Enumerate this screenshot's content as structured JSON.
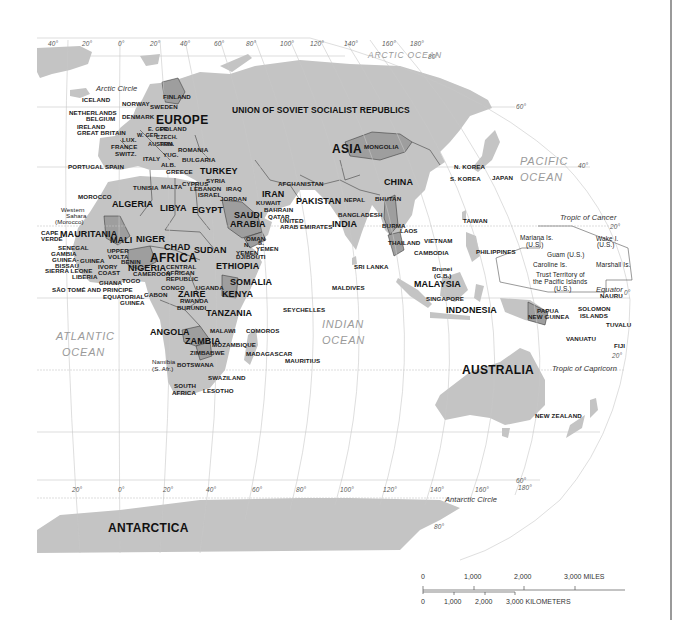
{
  "map": {
    "colors": {
      "land": "#c4c4c4",
      "highlight": "#9e9e9e",
      "ocean": "#ffffff",
      "graticule": "#bdbdbd",
      "border": "#2a2a2a",
      "ocean_label": "#9a9a9a"
    },
    "continents": {
      "europe": "EUROPE",
      "asia": "ASIA",
      "africa": "AFRICA",
      "australia": "AUSTRALIA",
      "antarctica": "ANTARCTICA"
    },
    "oceans": {
      "arctic": "ARCTIC OCEAN",
      "pacific_1": "PACIFIC",
      "pacific_2": "OCEAN",
      "atlantic_1": "ATLANTIC",
      "atlantic_2": "OCEAN",
      "indian_1": "INDIAN",
      "indian_2": "OCEAN"
    },
    "lines": {
      "arctic_circle": "Arctic Circle",
      "tropic_cancer": "Tropic of Cancer",
      "equator": "Equator",
      "tropic_capricorn": "Tropic of Capricorn",
      "antarctic_circle": "Antarctic Circle"
    },
    "graticule_top": [
      "40°",
      "20°",
      "0°",
      "20°",
      "40°",
      "60°",
      "80°",
      "100°",
      "120°",
      "140°",
      "160°",
      "180°"
    ],
    "graticule_bottom": [
      "20°",
      "0°",
      "20°",
      "40°",
      "60°",
      "80°",
      "100°",
      "120°",
      "140°",
      "160°",
      "180°"
    ],
    "latitudes": {
      "n80": "80°",
      "n60": "60°",
      "n40": "40°",
      "n20": "20°",
      "eq": "0°",
      "s20": "20°",
      "s60": "60°",
      "s80": "80°"
    },
    "countries": {
      "ussr": "UNION OF SOVIET SOCIALIST REPUBLICS",
      "iceland": "ICELAND",
      "norway": "NORWAY",
      "sweden": "SWEDEN",
      "finland": "FINLAND",
      "netherlands": "NETHERLANDS",
      "belgium": "BELGIUM",
      "denmark": "DENMARK",
      "ireland": "IRELAND",
      "great_britain": "GREAT BRITAIN",
      "poland": "POLAND",
      "w_ger": "W. GER.",
      "e_ger": "E. GER.",
      "czech": "CZECH.",
      "lux": "LUX.",
      "france": "FRANCE",
      "austria": "AUSTRIA",
      "hun": "HUN.",
      "switz": "SWITZ.",
      "romania": "ROMANIA",
      "yug": "YUG.",
      "italy": "ITALY",
      "bulgaria": "BULGARIA",
      "alb": "ALB.",
      "greece": "GREECE",
      "portugal": "PORTUGAL",
      "spain": "SPAIN",
      "turkey": "TURKEY",
      "cyprus": "CYPRUS",
      "syria": "SYRIA",
      "lebanon": "LEBANON",
      "israel": "ISRAEL",
      "iraq": "IRAQ",
      "jordan": "JORDAN",
      "iran": "IRAN",
      "afghanistan": "AFGHANISTAN",
      "kuwait": "KUWAIT",
      "bahrain": "BAHRAIN",
      "qatar": "QATAR",
      "uae_1": "UNITED",
      "uae_2": "ARAB EMIRATES",
      "pakistan": "PAKISTAN",
      "nepal": "NEPAL",
      "bhutan": "BHUTAN",
      "bangladesh": "BANGLADESH",
      "india": "INDIA",
      "mongolia": "MONGOLIA",
      "china": "CHINA",
      "n_korea": "N. KOREA",
      "s_korea": "S. KOREA",
      "japan": "JAPAN",
      "taiwan": "TAIWAN",
      "burma": "BURMA",
      "laos": "LAOS",
      "thailand": "THAILAND",
      "vietnam": "VIETNAM",
      "cambodia": "CAMBODIA",
      "philippines": "PHILIPPINES",
      "sri_lanka": "SRI LANKA",
      "maldives": "MALDIVES",
      "brunei_1": "Brunei",
      "brunei_2": "(G.B.)",
      "malaysia": "MALAYSIA",
      "singapore": "SINGAPORE",
      "indonesia": "INDONESIA",
      "png_1": "PAPUA",
      "png_2": "NEW GUINEA",
      "solomon_1": "SOLOMON",
      "solomon_2": "ISLANDS",
      "nauru": "NAURU",
      "tuvalu": "TUVALU",
      "vanuatu": "VANUATU",
      "fiji": "FIJI",
      "new_zealand": "NEW ZEALAND",
      "saudi_1": "SAUDI",
      "saudi_2": "ARABIA",
      "oman": "OMAN",
      "n_yemen_1": "N.",
      "n_yemen_2": "YEMEN",
      "s_yemen_1": "S.",
      "s_yemen_2": "YEMEN",
      "morocco": "MOROCCO",
      "tunisia": "TUNISIA",
      "malta": "MALTA",
      "algeria": "ALGERIA",
      "libya": "LIBYA",
      "egypt": "EGYPT",
      "w_sahara_1": "Western",
      "w_sahara_2": "Sahara",
      "w_sahara_3": "(Morocco)",
      "cape_verde_1": "CAPE",
      "cape_verde_2": "VERDE",
      "mauritania": "MAURITANIA",
      "mali": "MALI",
      "niger": "NIGER",
      "chad": "CHAD",
      "sudan": "SUDAN",
      "senegal": "SENEGAL",
      "gambia": "GAMBIA",
      "guinea_bissau_1": "GUINEA-",
      "guinea_bissau_2": "BISSAU",
      "guinea": "GUINEA",
      "upper_volta_1": "UPPER",
      "upper_volta_2": "VOLTA",
      "benin": "BENIN",
      "nigeria": "NIGERIA",
      "sierra_leone": "SIERRA LEONE",
      "liberia": "LIBERIA",
      "ivory_coast_1": "IVORY",
      "ivory_coast_2": "COAST",
      "ghana": "GHANA",
      "togo": "TOGO",
      "cameroon": "CAMEROON",
      "car_1": "CENTRAL",
      "car_2": "AFRICAN",
      "car_3": "REPUBLIC",
      "ethiopia": "ETHIOPIA",
      "djibouti": "DJIBOUTI",
      "somalia": "SOMALIA",
      "sao_tome": "SÃO TOMÉ AND PRINCIPE",
      "eq_guinea_1": "EQUATORIAL",
      "eq_guinea_2": "GUINEA",
      "gabon": "GABON",
      "congo": "CONGO",
      "zaire": "ZAIRE",
      "uganda": "UGANDA",
      "kenya": "KENYA",
      "rwanda": "RWANDA",
      "burundi": "BURUNDI",
      "tanzania": "TANZANIA",
      "seychelles": "SEYCHELLES",
      "angola": "ANGOLA",
      "malawi": "MALAWI",
      "comoros": "COMOROS",
      "zambia": "ZAMBIA",
      "mozambique": "MOZAMBIQUE",
      "zimbabwe": "ZIMBABWE",
      "madagascar": "MADAGASCAR",
      "mauritius": "MAURITIUS",
      "namibia_1": "Namibia",
      "namibia_2": "(S. Afr.)",
      "botswana": "BOTSWANA",
      "swaziland": "SWAZILAND",
      "south_africa_1": "SOUTH",
      "south_africa_2": "AFRICA",
      "lesotho": "LESOTHO"
    },
    "pacific_territories": {
      "mariana_1": "Mariana Is.",
      "mariana_2": "(U.S.)",
      "guam": "Guam (U.S.)",
      "caroline": "Caroline Is.",
      "wake_1": "Wake I.",
      "wake_2": "(U.S.)",
      "marshall": "Marshall Is.",
      "trust_1": "Trust Territory of",
      "trust_2": "the Pacific Islands",
      "trust_3": "(U.S.)"
    },
    "scale_bar": {
      "miles": [
        "0",
        "1,000",
        "2,000",
        "3,000 MILES"
      ],
      "kilometers": [
        "0",
        "1,000",
        "2,000",
        "3,000 KILOMETERS"
      ]
    }
  }
}
